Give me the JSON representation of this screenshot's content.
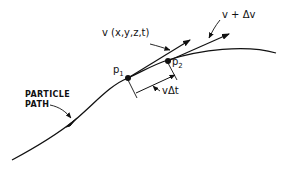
{
  "diagram": {
    "type": "particle-path-velocity",
    "colors": {
      "ink": "#111111",
      "background": "#ffffff"
    },
    "labels": {
      "particle_path_line1": "PARTICLE",
      "particle_path_line2": "PATH",
      "velocity": "v (x,y,z,t)",
      "velocity_plus_delta": "v + Δv",
      "displacement": "vΔt",
      "point1_letter": "p",
      "point1_sub": "1",
      "point2_letter": "p",
      "point2_sub": "2"
    },
    "nodes": [
      {
        "id": "p1",
        "label": "p1"
      },
      {
        "id": "p2",
        "label": "p2"
      }
    ],
    "edges": [
      {
        "from": "p1",
        "to": "v-tip",
        "label": "v (x,y,z,t)"
      },
      {
        "from": "p2",
        "to": "v+dv-tip",
        "label": "v + Δv"
      },
      {
        "from": "p1",
        "to": "p2",
        "label": "vΔt"
      }
    ]
  }
}
